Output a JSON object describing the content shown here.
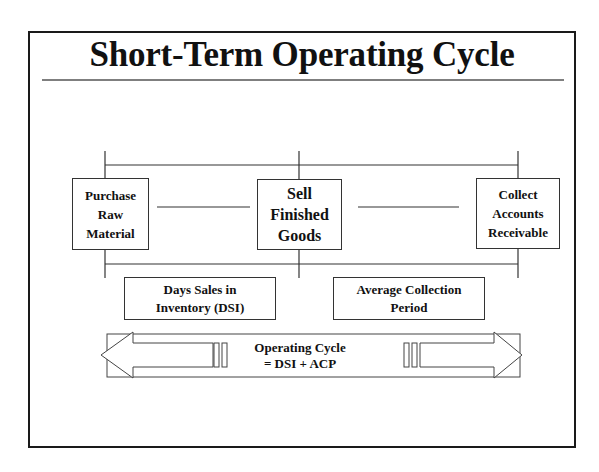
{
  "slide": {
    "title": "Short-Term Operating Cycle"
  },
  "stages": [
    {
      "lines": [
        "Purchase",
        "Raw",
        "Material"
      ]
    },
    {
      "lines": [
        "Sell",
        "Finished",
        "Goods"
      ]
    },
    {
      "lines": [
        "Collect",
        "Accounts",
        "Receivable"
      ]
    }
  ],
  "periods": [
    {
      "lines": [
        "Days Sales in",
        "Inventory (DSI)"
      ]
    },
    {
      "lines": [
        "Average Collection",
        "Period"
      ]
    }
  ],
  "operating_cycle": {
    "lines": [
      "Operating Cycle",
      "= DSI + ACP"
    ]
  },
  "colors": {
    "line": "#333333",
    "frame": "#1a1a1a",
    "background": "#ffffff"
  }
}
